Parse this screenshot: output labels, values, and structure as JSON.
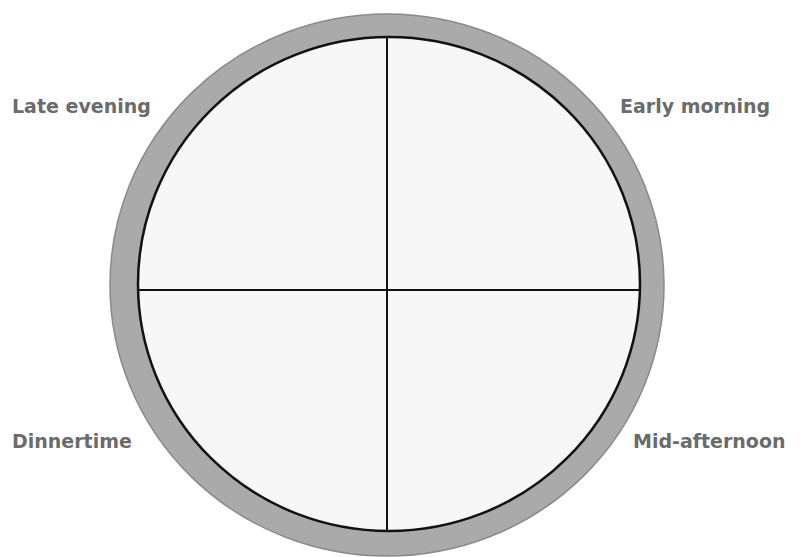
{
  "quadrant_labels": {
    "top_left": "Late evening",
    "top_right": "Early morning",
    "bottom_left": "Dinnertime",
    "bottom_right": "Mid-afternoon"
  },
  "colors": {
    "ring": "#a9a9a9",
    "ring_edge": "#7a7a7a",
    "inner_fill": "#f7f7f7",
    "lines": "#111111",
    "label_text": "#6b6b6b"
  }
}
